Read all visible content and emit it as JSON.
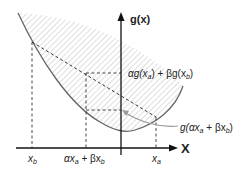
{
  "diagram": {
    "axes": {
      "y_label": "g(x)",
      "x_label": "X"
    },
    "labels": {
      "chord_value": "αg(x",
      "chord_value_sub_a": "a",
      "chord_value_mid": ") + βg(x",
      "chord_value_sub_b": "b",
      "chord_value_end": ")",
      "func_value": "g(αx",
      "func_value_sub_a": "a",
      "func_value_mid": " + βx",
      "func_value_sub_b": "b",
      "func_value_end": ")",
      "tick_xb": "x",
      "tick_xb_sub": "b",
      "tick_mid": "αx",
      "tick_mid_sub_a": "a",
      "tick_mid_plus": " + βx",
      "tick_mid_sub_b": "b",
      "tick_xa": "x",
      "tick_xa_sub": "a"
    },
    "colors": {
      "curve": "#666666",
      "axis": "#111111",
      "hatch": "#cccccc",
      "dashed": "#333333",
      "arrow": "#999999"
    }
  }
}
